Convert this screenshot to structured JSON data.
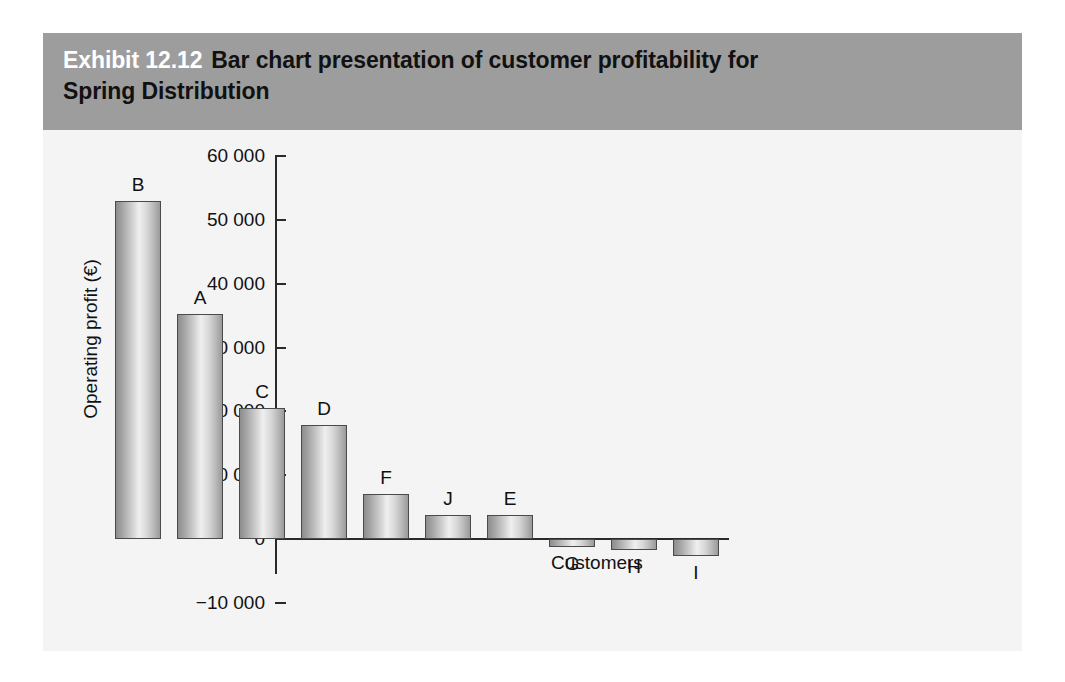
{
  "exhibit": {
    "number": "Exhibit 12.12",
    "title_line1": "Bar chart presentation of customer profitability for",
    "title_line2": "Spring Distribution",
    "band_color": "#9d9d9d",
    "panel_color": "#f4f4f4"
  },
  "chart_data": {
    "type": "bar",
    "title": "Bar chart presentation of customer profitability for Spring Distribution",
    "xlabel": "Customers",
    "ylabel": "Operating profit (€)",
    "categories": [
      "B",
      "A",
      "C",
      "D",
      "F",
      "J",
      "E",
      "G",
      "H",
      "I"
    ],
    "values": [
      53000,
      35200,
      20500,
      17800,
      7000,
      3700,
      3700,
      -1200,
      -1700,
      -2600
    ],
    "ylim": [
      -10000,
      60000
    ],
    "ytick_values": [
      60000,
      50000,
      40000,
      30000,
      20000,
      10000,
      0,
      -10000
    ],
    "ytick_labels": [
      "60 000",
      "50 000",
      "40 000",
      "30 000",
      "20 000",
      "10 000",
      "0",
      "−10 000"
    ],
    "grid": false,
    "legend": false,
    "bar_fill": "#d2d2d2",
    "bar_edge": "#4a4a4a",
    "axis_color": "#2a2a2a"
  }
}
